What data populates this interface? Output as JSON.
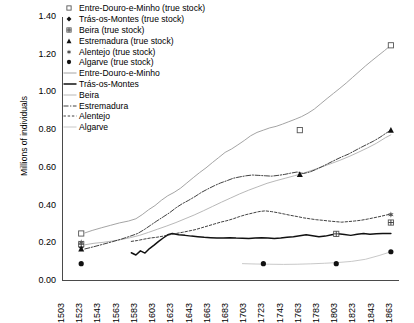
{
  "chart_data": {
    "type": "line",
    "title": "",
    "xlabel": "",
    "ylabel": "Millions of individuals",
    "ylim": [
      0.0,
      1.4
    ],
    "xlim": [
      1503,
      1873
    ],
    "ytick_labels": [
      "1.40",
      "1.20",
      "1.00",
      "0.80",
      "0.60",
      "0.40",
      "0.20",
      "0.00"
    ],
    "ytick_values": [
      1.4,
      1.2,
      1.0,
      0.8,
      0.6,
      0.4,
      0.2,
      0.0
    ],
    "xtick_labels": [
      "1503",
      "1523",
      "1543",
      "1563",
      "1583",
      "1603",
      "1623",
      "1643",
      "1663",
      "1683",
      "1703",
      "1723",
      "1743",
      "1763",
      "1783",
      "1803",
      "1823",
      "1843",
      "1863"
    ],
    "xtick_values": [
      1503,
      1523,
      1543,
      1563,
      1583,
      1603,
      1623,
      1643,
      1663,
      1683,
      1703,
      1723,
      1743,
      1763,
      1783,
      1803,
      1823,
      1843,
      1863
    ],
    "grid": false,
    "legend_position": "top-left",
    "legend": [
      {
        "label": "Entre-Douro-e-Minho (true stock)",
        "marker": "open-square",
        "style": "marker"
      },
      {
        "label": "Trás-os-Montes (true stock)",
        "marker": "filled-diamond",
        "style": "marker"
      },
      {
        "label": "Beira (true stock)",
        "marker": "plus-square",
        "style": "marker"
      },
      {
        "label": "Estremadura (true stock)",
        "marker": "filled-triangle",
        "style": "marker"
      },
      {
        "label": "Alentejo (true stock)",
        "marker": "star",
        "style": "marker"
      },
      {
        "label": "Algarve (true stock)",
        "marker": "filled-circle",
        "style": "marker"
      },
      {
        "label": "Entre-Douro-e-Minho",
        "marker": "none",
        "style": "solid-light"
      },
      {
        "label": "Trás-os-Montes",
        "marker": "none",
        "style": "solid-bold"
      },
      {
        "label": "Beira",
        "marker": "none",
        "style": "solid-thin"
      },
      {
        "label": "Estremadura",
        "marker": "none",
        "style": "dash-dot"
      },
      {
        "label": "Alentejo",
        "marker": "none",
        "style": "dashed"
      },
      {
        "label": "Algarve",
        "marker": "none",
        "style": "solid-pale"
      }
    ],
    "series": [
      {
        "name": "Entre-Douro-e-Minho",
        "style": "solid-light",
        "x": [
          1527,
          1535,
          1545,
          1555,
          1565,
          1575,
          1583,
          1590,
          1597,
          1604,
          1611,
          1618,
          1625,
          1632,
          1639,
          1646,
          1653,
          1660,
          1667,
          1674,
          1681,
          1688,
          1695,
          1702,
          1709,
          1716,
          1723,
          1730,
          1737,
          1744,
          1751,
          1758,
          1765,
          1772,
          1779,
          1786,
          1793,
          1800,
          1807,
          1814,
          1821,
          1828,
          1835,
          1842,
          1849,
          1856,
          1863
        ],
        "y": [
          0.255,
          0.268,
          0.282,
          0.295,
          0.308,
          0.318,
          0.33,
          0.352,
          0.378,
          0.4,
          0.428,
          0.452,
          0.47,
          0.492,
          0.52,
          0.548,
          0.575,
          0.6,
          0.628,
          0.655,
          0.682,
          0.7,
          0.722,
          0.745,
          0.77,
          0.788,
          0.8,
          0.812,
          0.82,
          0.832,
          0.845,
          0.858,
          0.872,
          0.89,
          0.912,
          0.94,
          0.968,
          0.995,
          1.022,
          1.05,
          1.08,
          1.11,
          1.14,
          1.168,
          1.195,
          1.222,
          1.25
        ]
      },
      {
        "name": "Trás-os-Montes",
        "style": "solid-bold",
        "x": [
          1578,
          1583,
          1588,
          1593,
          1598,
          1603,
          1608,
          1613,
          1618,
          1623,
          1630,
          1637,
          1644,
          1651,
          1658,
          1665,
          1672,
          1679,
          1686,
          1693,
          1700,
          1707,
          1714,
          1721,
          1728,
          1735,
          1742,
          1749,
          1756,
          1763,
          1770,
          1777,
          1784,
          1791,
          1798,
          1805,
          1812,
          1819,
          1826,
          1833,
          1840,
          1847,
          1854,
          1863
        ],
        "y": [
          0.15,
          0.138,
          0.16,
          0.148,
          0.172,
          0.19,
          0.21,
          0.228,
          0.245,
          0.252,
          0.245,
          0.242,
          0.238,
          0.235,
          0.232,
          0.23,
          0.228,
          0.228,
          0.23,
          0.228,
          0.227,
          0.226,
          0.228,
          0.23,
          0.228,
          0.226,
          0.228,
          0.232,
          0.235,
          0.24,
          0.245,
          0.24,
          0.235,
          0.238,
          0.245,
          0.25,
          0.246,
          0.242,
          0.248,
          0.252,
          0.248,
          0.25,
          0.252,
          0.252
        ]
      },
      {
        "name": "Beira",
        "style": "solid-thin",
        "x": [
          1527,
          1537,
          1547,
          1557,
          1567,
          1577,
          1587,
          1597,
          1607,
          1617,
          1627,
          1637,
          1647,
          1657,
          1667,
          1677,
          1687,
          1697,
          1707,
          1717,
          1727,
          1737,
          1747,
          1757,
          1767,
          1777,
          1787,
          1797,
          1807,
          1817,
          1827,
          1837,
          1847,
          1857,
          1863
        ],
        "y": [
          0.192,
          0.2,
          0.205,
          0.212,
          0.22,
          0.23,
          0.242,
          0.258,
          0.275,
          0.292,
          0.31,
          0.33,
          0.35,
          0.372,
          0.395,
          0.418,
          0.44,
          0.462,
          0.482,
          0.5,
          0.518,
          0.532,
          0.545,
          0.558,
          0.572,
          0.588,
          0.605,
          0.622,
          0.64,
          0.66,
          0.682,
          0.705,
          0.73,
          0.76,
          0.775
        ]
      },
      {
        "name": "Estremadura",
        "style": "dash-dot",
        "x": [
          1527,
          1537,
          1547,
          1557,
          1567,
          1577,
          1585,
          1592,
          1599,
          1606,
          1613,
          1620,
          1627,
          1634,
          1641,
          1648,
          1655,
          1662,
          1669,
          1676,
          1683,
          1690,
          1697,
          1704,
          1711,
          1718,
          1725,
          1732,
          1739,
          1746,
          1753,
          1760,
          1767,
          1774,
          1781,
          1788,
          1795,
          1802,
          1809,
          1816,
          1823,
          1830,
          1837,
          1844,
          1851,
          1858,
          1863
        ],
        "y": [
          0.17,
          0.182,
          0.195,
          0.208,
          0.222,
          0.238,
          0.252,
          0.272,
          0.295,
          0.318,
          0.34,
          0.362,
          0.388,
          0.41,
          0.428,
          0.448,
          0.47,
          0.488,
          0.505,
          0.52,
          0.532,
          0.545,
          0.552,
          0.558,
          0.562,
          0.56,
          0.558,
          0.556,
          0.56,
          0.565,
          0.572,
          0.578,
          0.57,
          0.578,
          0.592,
          0.608,
          0.625,
          0.642,
          0.658,
          0.672,
          0.69,
          0.708,
          0.725,
          0.742,
          0.762,
          0.785,
          0.8
        ]
      },
      {
        "name": "Alentejo",
        "style": "dashed",
        "x": [
          1578,
          1585,
          1592,
          1599,
          1606,
          1613,
          1620,
          1627,
          1634,
          1641,
          1648,
          1655,
          1662,
          1669,
          1676,
          1683,
          1690,
          1697,
          1704,
          1711,
          1718,
          1725,
          1732,
          1739,
          1746,
          1753,
          1760,
          1767,
          1774,
          1781,
          1788,
          1795,
          1802,
          1809,
          1816,
          1823,
          1830,
          1837,
          1844,
          1851,
          1858,
          1863
        ],
        "y": [
          0.21,
          0.215,
          0.222,
          0.228,
          0.232,
          0.238,
          0.245,
          0.252,
          0.258,
          0.265,
          0.272,
          0.282,
          0.292,
          0.302,
          0.312,
          0.32,
          0.33,
          0.342,
          0.352,
          0.36,
          0.368,
          0.372,
          0.368,
          0.362,
          0.355,
          0.348,
          0.342,
          0.335,
          0.33,
          0.325,
          0.322,
          0.318,
          0.315,
          0.312,
          0.315,
          0.318,
          0.322,
          0.328,
          0.335,
          0.342,
          0.35,
          0.355
        ]
      },
      {
        "name": "Algarve",
        "style": "solid-pale",
        "x": [
          1700,
          1715,
          1730,
          1745,
          1760,
          1775,
          1790,
          1805,
          1820,
          1835,
          1850,
          1863
        ],
        "y": [
          0.092,
          0.09,
          0.089,
          0.088,
          0.089,
          0.091,
          0.094,
          0.098,
          0.104,
          0.115,
          0.135,
          0.155
        ]
      }
    ],
    "true_stock_points": [
      {
        "series": "Entre-Douro-e-Minho",
        "marker": "open-square",
        "points": [
          [
            1523,
            0.252
          ],
          [
            1763,
            0.8
          ],
          [
            1863,
            1.25
          ]
        ]
      },
      {
        "series": "Trás-os-Montes",
        "marker": "filled-diamond",
        "points": [
          [
            1523,
            0.182
          ]
        ]
      },
      {
        "series": "Beira",
        "marker": "plus-square",
        "points": [
          [
            1523,
            0.195
          ],
          [
            1803,
            0.25
          ],
          [
            1863,
            0.31
          ]
        ]
      },
      {
        "series": "Estremadura",
        "marker": "filled-triangle",
        "points": [
          [
            1523,
            0.17
          ],
          [
            1763,
            0.565
          ],
          [
            1863,
            0.8
          ]
        ]
      },
      {
        "series": "Alentejo",
        "marker": "star",
        "points": [
          [
            1523,
            0.205
          ],
          [
            1863,
            0.352
          ]
        ]
      },
      {
        "series": "Algarve",
        "marker": "filled-circle",
        "points": [
          [
            1523,
            0.092
          ],
          [
            1723,
            0.092
          ],
          [
            1803,
            0.092
          ],
          [
            1863,
            0.155
          ]
        ]
      }
    ]
  }
}
